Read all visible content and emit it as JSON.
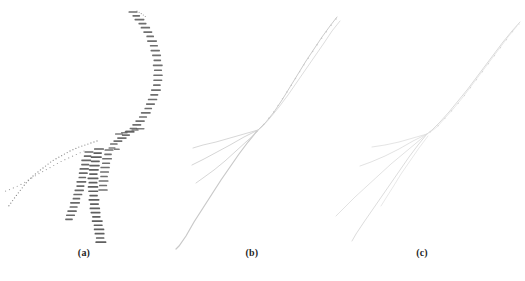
{
  "figure": {
    "background": "#ffffff",
    "caption_color": "#1f1f1f",
    "panels": [
      {
        "id": "a",
        "label": "(a)",
        "description": "branching curve rendered as dense tiny labels with two dotted branches"
      },
      {
        "id": "b",
        "label": "(b)",
        "description": "branching curve rendered as faint thin gray strokes with branch fan"
      },
      {
        "id": "c",
        "label": "(c)",
        "description": "branching curve rendered as very faint thin strokes with branch fan"
      }
    ],
    "colors": {
      "label_dash": "#565656",
      "dotted_branch": "#8f8f8f",
      "curves_b": "#cbcbcb",
      "curves_c": "#d6d6d6"
    },
    "strokes": [
      {
        "panel": "a",
        "kind": "dots",
        "color": "#9a9a9a",
        "r": 0.6,
        "spacing": 2.5,
        "points": [
          [
            137,
            11
          ],
          [
            142,
            14
          ],
          [
            146,
            17
          ]
        ]
      },
      {
        "panel": "a",
        "kind": "dashes",
        "color": "#565656",
        "opacity": 0.85,
        "w": 9,
        "h": 1.7,
        "spacing": 5,
        "points": [
          [
            133,
            12
          ],
          [
            139,
            19
          ],
          [
            145,
            27
          ],
          [
            150,
            36
          ],
          [
            154,
            46
          ],
          [
            157,
            57
          ],
          [
            158,
            68
          ],
          [
            158,
            79
          ],
          [
            156,
            90
          ],
          [
            152,
            101
          ],
          [
            147,
            111
          ],
          [
            141,
            120
          ],
          [
            134,
            128
          ],
          [
            126,
            135
          ],
          [
            118,
            141
          ],
          [
            111,
            146
          ]
        ]
      },
      {
        "panel": "a",
        "kind": "dashes",
        "color": "#5e5e5e",
        "opacity": 0.8,
        "w": 8,
        "h": 1.5,
        "spacing": 5.5,
        "points": [
          [
            119,
            134
          ],
          [
            127,
            132
          ],
          [
            135,
            130
          ],
          [
            143,
            128
          ]
        ]
      },
      {
        "panel": "a",
        "kind": "dashes",
        "color": "#5e5e5e",
        "opacity": 0.8,
        "w": 7,
        "h": 1.5,
        "spacing": 5,
        "points": [
          [
            112,
            148
          ],
          [
            119,
            150
          ]
        ]
      },
      {
        "panel": "a",
        "kind": "dots",
        "color": "#8f8f8f",
        "r": 0.65,
        "spacing": 3.2,
        "points": [
          [
            97,
            141
          ],
          [
            88,
            144
          ],
          [
            79,
            147
          ],
          [
            70,
            151
          ],
          [
            61,
            156
          ],
          [
            52,
            161
          ],
          [
            43,
            168
          ],
          [
            34,
            175
          ],
          [
            26,
            183
          ],
          [
            19,
            192
          ],
          [
            13,
            200
          ],
          [
            8,
            207
          ]
        ]
      },
      {
        "panel": "a",
        "kind": "dots",
        "color": "#9c9c9c",
        "r": 0.6,
        "spacing": 4.2,
        "points": [
          [
            84,
            151
          ],
          [
            73,
            156
          ],
          [
            62,
            161
          ],
          [
            51,
            167
          ],
          [
            40,
            173
          ],
          [
            30,
            179
          ],
          [
            20,
            185
          ],
          [
            11,
            189
          ],
          [
            3,
            192
          ]
        ]
      },
      {
        "panel": "a",
        "kind": "dashes",
        "color": "#545454",
        "opacity": 0.88,
        "w": 9,
        "h": 1.7,
        "spacing": 4.4,
        "points": [
          [
            89,
            152
          ],
          [
            86,
            161
          ],
          [
            84,
            170
          ],
          [
            82,
            179
          ],
          [
            80,
            188
          ],
          [
            77,
            197
          ],
          [
            74,
            206
          ],
          [
            71,
            214
          ],
          [
            68,
            222
          ]
        ]
      },
      {
        "panel": "a",
        "kind": "dashes",
        "color": "#4f4f4f",
        "opacity": 0.9,
        "w": 10,
        "h": 1.7,
        "spacing": 4.3,
        "points": [
          [
            99,
            149
          ],
          [
            96,
            158
          ],
          [
            94,
            168
          ],
          [
            93,
            178
          ],
          [
            93,
            189
          ],
          [
            94,
            200
          ],
          [
            95,
            210
          ],
          [
            97,
            220
          ],
          [
            99,
            229
          ],
          [
            100,
            237
          ],
          [
            101,
            243
          ]
        ]
      },
      {
        "panel": "a",
        "kind": "dashes",
        "color": "#585858",
        "opacity": 0.85,
        "w": 9,
        "h": 1.6,
        "spacing": 4.5,
        "points": [
          [
            109,
            150
          ],
          [
            107,
            159
          ],
          [
            105,
            168
          ],
          [
            104,
            177
          ],
          [
            103,
            186
          ],
          [
            103,
            193
          ]
        ]
      },
      {
        "panel": "b",
        "kind": "line",
        "color": "#cbcbcb",
        "width": 1,
        "points": [
          [
            337,
            17
          ],
          [
            330,
            26
          ],
          [
            322,
            37
          ],
          [
            314,
            49
          ],
          [
            306,
            61
          ],
          [
            298,
            74
          ],
          [
            290,
            87
          ],
          [
            282,
            100
          ],
          [
            274,
            112
          ],
          [
            266,
            122
          ],
          [
            258,
            130
          ]
        ]
      },
      {
        "panel": "b",
        "kind": "line",
        "color": "#d4d4d4",
        "width": 0.8,
        "points": [
          [
            340,
            21
          ],
          [
            332,
            31
          ],
          [
            324,
            43
          ],
          [
            315,
            56
          ],
          [
            306,
            69
          ],
          [
            297,
            82
          ],
          [
            288,
            95
          ],
          [
            279,
            107
          ],
          [
            270,
            118
          ],
          [
            262,
            127
          ],
          [
            257,
            131
          ]
        ]
      },
      {
        "panel": "b",
        "kind": "dots",
        "color": "#c6c6c6",
        "r": 0.7,
        "spacing": 8,
        "points": [
          [
            336,
            19
          ],
          [
            329,
            28
          ],
          [
            321,
            39
          ],
          [
            313,
            51
          ],
          [
            305,
            63
          ],
          [
            297,
            76
          ],
          [
            289,
            89
          ],
          [
            281,
            101
          ],
          [
            273,
            113
          ],
          [
            265,
            123
          ],
          [
            258,
            130
          ]
        ]
      },
      {
        "panel": "b",
        "kind": "line",
        "color": "#c9c9c9",
        "width": 1.2,
        "points": [
          [
            257,
            131
          ],
          [
            248,
            142
          ],
          [
            239,
            154
          ],
          [
            230,
            167
          ],
          [
            221,
            180
          ],
          [
            212,
            194
          ],
          [
            203,
            208
          ],
          [
            194,
            222
          ],
          [
            186,
            236
          ],
          [
            179,
            246
          ],
          [
            176,
            249
          ]
        ]
      },
      {
        "panel": "b",
        "kind": "line",
        "color": "#d3d3d3",
        "width": 0.9,
        "points": [
          [
            258,
            130
          ],
          [
            244,
            134
          ],
          [
            230,
            138
          ],
          [
            216,
            142
          ],
          [
            203,
            145
          ],
          [
            193,
            148
          ]
        ]
      },
      {
        "panel": "b",
        "kind": "line",
        "color": "#d0d0d0",
        "width": 0.9,
        "points": [
          [
            258,
            130
          ],
          [
            244,
            137
          ],
          [
            230,
            145
          ],
          [
            217,
            152
          ],
          [
            204,
            159
          ],
          [
            192,
            165
          ]
        ]
      },
      {
        "panel": "b",
        "kind": "line",
        "color": "#d2d2d2",
        "width": 0.9,
        "points": [
          [
            258,
            131
          ],
          [
            247,
            141
          ],
          [
            236,
            151
          ],
          [
            225,
            161
          ],
          [
            214,
            170
          ],
          [
            203,
            178
          ],
          [
            196,
            183
          ]
        ]
      },
      {
        "panel": "c",
        "kind": "line",
        "color": "#d6d6d6",
        "width": 0.9,
        "points": [
          [
            520,
            22
          ],
          [
            512,
            31
          ],
          [
            503,
            42
          ],
          [
            494,
            54
          ],
          [
            485,
            66
          ],
          [
            476,
            78
          ],
          [
            467,
            90
          ],
          [
            458,
            101
          ],
          [
            449,
            112
          ],
          [
            440,
            122
          ],
          [
            432,
            130
          ],
          [
            427,
            134
          ]
        ]
      },
      {
        "panel": "c",
        "kind": "line",
        "color": "#dedede",
        "width": 0.7,
        "points": [
          [
            517,
            26
          ],
          [
            508,
            37
          ],
          [
            499,
            49
          ],
          [
            490,
            61
          ],
          [
            481,
            73
          ],
          [
            472,
            85
          ],
          [
            463,
            97
          ],
          [
            454,
            108
          ],
          [
            445,
            118
          ],
          [
            437,
            127
          ],
          [
            429,
            133
          ]
        ]
      },
      {
        "panel": "c",
        "kind": "dots",
        "color": "#d2d2d2",
        "r": 0.6,
        "spacing": 10,
        "points": [
          [
            519,
            24
          ],
          [
            510,
            35
          ],
          [
            501,
            47
          ],
          [
            492,
            59
          ],
          [
            483,
            71
          ],
          [
            474,
            83
          ],
          [
            465,
            95
          ],
          [
            456,
            106
          ],
          [
            447,
            116
          ],
          [
            439,
            125
          ],
          [
            430,
            132
          ]
        ]
      },
      {
        "panel": "c",
        "kind": "line",
        "color": "#d8d8d8",
        "width": 0.9,
        "points": [
          [
            427,
            134
          ],
          [
            418,
            145
          ],
          [
            409,
            157
          ],
          [
            400,
            170
          ],
          [
            391,
            183
          ],
          [
            382,
            196
          ],
          [
            373,
            209
          ],
          [
            364,
            222
          ],
          [
            356,
            234
          ],
          [
            352,
            241
          ]
        ]
      },
      {
        "panel": "c",
        "kind": "line",
        "color": "#dddddd",
        "width": 0.8,
        "points": [
          [
            427,
            134
          ],
          [
            413,
            138
          ],
          [
            399,
            142
          ],
          [
            385,
            145
          ],
          [
            372,
            147
          ]
        ]
      },
      {
        "panel": "c",
        "kind": "line",
        "color": "#dbdbdb",
        "width": 0.8,
        "points": [
          [
            427,
            134
          ],
          [
            413,
            141
          ],
          [
            399,
            149
          ],
          [
            385,
            156
          ],
          [
            371,
            162
          ],
          [
            360,
            166
          ]
        ]
      },
      {
        "panel": "c",
        "kind": "line",
        "color": "#dadada",
        "width": 0.8,
        "points": [
          [
            427,
            134
          ],
          [
            415,
            144
          ],
          [
            403,
            154
          ],
          [
            391,
            164
          ],
          [
            379,
            175
          ],
          [
            367,
            186
          ],
          [
            355,
            197
          ],
          [
            344,
            208
          ],
          [
            336,
            216
          ]
        ]
      },
      {
        "panel": "c",
        "kind": "line",
        "color": "#dedede",
        "width": 0.7,
        "points": [
          [
            428,
            136
          ],
          [
            419,
            148
          ],
          [
            410,
            161
          ],
          [
            401,
            174
          ],
          [
            393,
            187
          ],
          [
            386,
            198
          ],
          [
            381,
            206
          ]
        ]
      }
    ]
  }
}
